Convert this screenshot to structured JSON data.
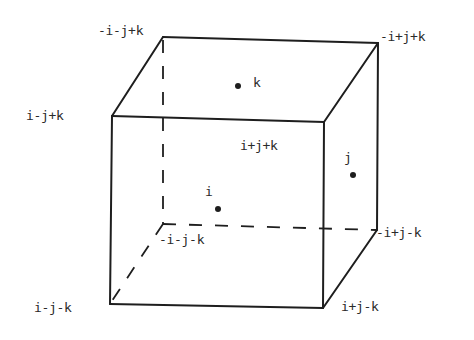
{
  "diagram": {
    "type": "cube-vertex-labels",
    "line_color": "#1e1e1e",
    "text_color": "#2a2a2a",
    "vertices": [
      {
        "id": "back_top_left",
        "label": "-i-j+k",
        "x": 163,
        "y": 37
      },
      {
        "id": "back_top_right",
        "label": "-i+j+k",
        "x": 378,
        "y": 43
      },
      {
        "id": "front_top_left",
        "label": "i-j+k",
        "x": 112,
        "y": 116
      },
      {
        "id": "front_top_right",
        "label": "i+j+k",
        "x": 324,
        "y": 122
      },
      {
        "id": "back_bottom_left",
        "label": "-i-j-k",
        "x": 163,
        "y": 224
      },
      {
        "id": "back_bottom_right",
        "label": "-i+j-k",
        "x": 377,
        "y": 230
      },
      {
        "id": "front_bottom_left",
        "label": "i-j-k",
        "x": 110,
        "y": 304
      },
      {
        "id": "front_bottom_right",
        "label": "i+j-k",
        "x": 323,
        "y": 308
      }
    ],
    "face_points": [
      {
        "id": "k",
        "label": "k",
        "x": 238,
        "y": 86,
        "face": "top"
      },
      {
        "id": "j",
        "label": "j",
        "x": 353,
        "y": 175,
        "face": "right"
      },
      {
        "id": "i",
        "label": "i",
        "x": 218,
        "y": 209,
        "face": "front"
      }
    ],
    "solid_edges": [
      [
        "front_top_left",
        "front_top_right"
      ],
      [
        "front_top_left",
        "front_bottom_left"
      ],
      [
        "front_top_right",
        "front_bottom_right"
      ],
      [
        "front_bottom_left",
        "front_bottom_right"
      ],
      [
        "back_top_left",
        "back_top_right"
      ],
      [
        "front_top_left",
        "back_top_left"
      ],
      [
        "front_top_right",
        "back_top_right"
      ],
      [
        "back_top_right",
        "back_bottom_right"
      ],
      [
        "front_bottom_right",
        "back_bottom_right"
      ]
    ],
    "dashed_edges": [
      [
        "back_top_left",
        "back_bottom_left"
      ],
      [
        "back_bottom_left",
        "back_bottom_right"
      ],
      [
        "back_bottom_left",
        "front_bottom_left"
      ]
    ]
  },
  "labels": {
    "v_back_top_left": "-i-j+k",
    "v_back_top_right": "-i+j+k",
    "v_front_top_left": "i-j+k",
    "v_front_top_right": "i+j+k",
    "v_back_bottom_left": "-i-j-k",
    "v_back_bottom_right": "-i+j-k",
    "v_front_bottom_left": "i-j-k",
    "v_front_bottom_right": "i+j-k",
    "p_k": "k",
    "p_j": "j",
    "p_i": "i"
  }
}
